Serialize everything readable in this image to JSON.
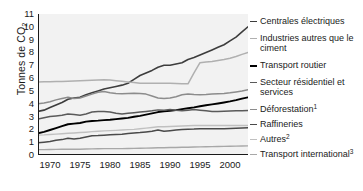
{
  "chart_data": {
    "type": "line",
    "title": "",
    "xlabel": "",
    "ylabel": "Tonnes de CO",
    "ylabel_sub": "2",
    "xlim": [
      1968,
      2003
    ],
    "ylim": [
      0,
      11
    ],
    "grid": false,
    "legend_position": "right",
    "yticks": [
      "0",
      "1",
      "2",
      "3",
      "4",
      "5",
      "6",
      "7",
      "8",
      "9",
      "10",
      "11"
    ],
    "ytick_values": [
      0,
      1,
      2,
      3,
      4,
      5,
      6,
      7,
      8,
      9,
      10,
      11
    ],
    "xticks": [
      "1970",
      "1975",
      "1980",
      "1985",
      "1990",
      "1995",
      "2000"
    ],
    "xtick_values": [
      1970,
      1975,
      1980,
      1985,
      1990,
      1995,
      2000
    ],
    "x": [
      1968,
      1969,
      1970,
      1971,
      1972,
      1973,
      1974,
      1975,
      1976,
      1977,
      1978,
      1979,
      1980,
      1981,
      1982,
      1983,
      1984,
      1985,
      1986,
      1987,
      1988,
      1989,
      1990,
      1991,
      1992,
      1993,
      1994,
      1995,
      1996,
      1997,
      1998,
      1999,
      2000,
      2001,
      2002,
      2003
    ],
    "series": [
      {
        "name": "Centrales électriques",
        "color": "#3d3d3d",
        "width": 1.6,
        "values": [
          3.4,
          3.5,
          3.7,
          3.9,
          4.1,
          4.35,
          4.45,
          4.5,
          4.7,
          4.85,
          5.0,
          5.15,
          5.25,
          5.35,
          5.45,
          5.6,
          5.9,
          6.2,
          6.4,
          6.6,
          6.85,
          7.0,
          7.0,
          7.1,
          7.2,
          7.45,
          7.6,
          7.8,
          8.0,
          8.2,
          8.4,
          8.6,
          8.9,
          9.2,
          9.6,
          10.0
        ]
      },
      {
        "name": "Industries autres que le ciment",
        "color": "#b0b0b0",
        "width": 1.5,
        "values": [
          5.7,
          5.72,
          5.72,
          5.73,
          5.74,
          5.76,
          5.78,
          5.8,
          5.82,
          5.84,
          5.86,
          5.88,
          5.85,
          5.8,
          5.75,
          5.7,
          5.65,
          5.6,
          5.6,
          5.6,
          5.6,
          5.6,
          5.6,
          5.58,
          5.56,
          5.55,
          6.4,
          7.2,
          7.25,
          7.3,
          7.38,
          7.45,
          7.55,
          7.68,
          7.85,
          8.0
        ]
      },
      {
        "name": "Transport routier",
        "color": "#000000",
        "width": 1.9,
        "values": [
          1.7,
          1.8,
          1.95,
          2.1,
          2.25,
          2.4,
          2.45,
          2.5,
          2.6,
          2.65,
          2.68,
          2.72,
          2.75,
          2.8,
          2.85,
          2.9,
          2.98,
          3.05,
          3.15,
          3.25,
          3.35,
          3.4,
          3.45,
          3.5,
          3.58,
          3.65,
          3.72,
          3.8,
          3.88,
          3.95,
          4.02,
          4.1,
          4.18,
          4.28,
          4.4,
          4.5
        ]
      },
      {
        "name": "Secteur résidentiel et services",
        "color": "#5a5a5a",
        "width": 1.5,
        "values": [
          2.8,
          2.9,
          3.0,
          3.05,
          3.1,
          3.2,
          3.15,
          3.1,
          3.2,
          3.35,
          3.4,
          3.4,
          3.35,
          3.25,
          3.2,
          3.25,
          3.3,
          3.35,
          3.4,
          3.45,
          3.52,
          3.5,
          3.55,
          3.5,
          3.45,
          3.5,
          3.55,
          3.5,
          3.45,
          3.4,
          3.4,
          3.42,
          3.44,
          3.45,
          3.46,
          3.47
        ]
      },
      {
        "name": "Déforestation",
        "superscript": "1",
        "color": "#8c8c8c",
        "width": 1.5,
        "values": [
          4.0,
          4.05,
          4.15,
          4.3,
          4.4,
          4.5,
          4.4,
          4.45,
          4.6,
          4.75,
          4.9,
          4.95,
          4.85,
          4.8,
          4.78,
          4.8,
          4.82,
          4.8,
          4.75,
          4.6,
          4.45,
          4.4,
          4.45,
          4.55,
          4.7,
          4.75,
          4.72,
          4.7,
          4.72,
          4.75,
          4.78,
          4.8,
          4.85,
          4.92,
          5.0,
          5.1
        ]
      },
      {
        "name": "Raffineries",
        "color": "#4a4a4a",
        "width": 1.5,
        "values": [
          0.95,
          1.0,
          1.05,
          1.15,
          1.2,
          1.3,
          1.25,
          1.3,
          1.4,
          1.5,
          1.52,
          1.55,
          1.58,
          1.6,
          1.62,
          1.68,
          1.72,
          1.75,
          1.8,
          1.85,
          1.95,
          1.85,
          1.9,
          1.95,
          1.98,
          2.0,
          2.02,
          2.05,
          2.05,
          2.05,
          2.05,
          2.05,
          2.06,
          2.08,
          2.1,
          2.12
        ]
      },
      {
        "name": "Autres",
        "superscript": "2",
        "color": "#c0c0c0",
        "width": 1.4,
        "values": [
          1.55,
          1.57,
          1.6,
          1.63,
          1.66,
          1.7,
          1.72,
          1.75,
          1.78,
          1.82,
          1.85,
          1.88,
          1.9,
          1.92,
          1.95,
          1.98,
          2.0,
          2.05,
          2.1,
          2.15,
          2.2,
          2.2,
          2.22,
          2.24,
          2.26,
          2.28,
          2.3,
          2.3,
          2.3,
          2.3,
          2.3,
          2.3,
          2.3,
          2.3,
          2.3,
          2.3
        ]
      },
      {
        "name": "Transport international",
        "superscript": "3",
        "color": "#a8a8a8",
        "width": 1.4,
        "values": [
          0.42,
          0.42,
          0.43,
          0.44,
          0.45,
          0.46,
          0.45,
          0.45,
          0.47,
          0.48,
          0.49,
          0.5,
          0.5,
          0.5,
          0.5,
          0.51,
          0.52,
          0.53,
          0.54,
          0.55,
          0.57,
          0.57,
          0.58,
          0.59,
          0.6,
          0.61,
          0.62,
          0.63,
          0.64,
          0.65,
          0.66,
          0.67,
          0.68,
          0.69,
          0.7,
          0.71
        ]
      }
    ]
  },
  "legend": {
    "items": [
      {
        "label": "Centrales électriques",
        "superscript": "",
        "color": "#3d3d3d",
        "width": 1.8
      },
      {
        "label": "Industries autres que le ciment",
        "superscript": "",
        "color": "#b0b0b0",
        "width": 1.8
      },
      {
        "label": "Transport routier",
        "superscript": "",
        "color": "#000000",
        "width": 2.2
      },
      {
        "label": "Secteur résidentiel et services",
        "superscript": "",
        "color": "#5a5a5a",
        "width": 1.8
      },
      {
        "label": "Déforestation",
        "superscript": "1",
        "color": "#8c8c8c",
        "width": 1.8
      },
      {
        "label": "Raffineries",
        "superscript": "",
        "color": "#4a4a4a",
        "width": 1.8
      },
      {
        "label": "Autres",
        "superscript": "2",
        "color": "#c0c0c0",
        "width": 1.6
      },
      {
        "label": "Transport international",
        "superscript": "3",
        "color": "#a8a8a8",
        "width": 1.6
      }
    ]
  },
  "style": {
    "plot_background": "#f2f2f2",
    "axis_color": "#1a1a1a",
    "page_background": "#ffffff"
  }
}
